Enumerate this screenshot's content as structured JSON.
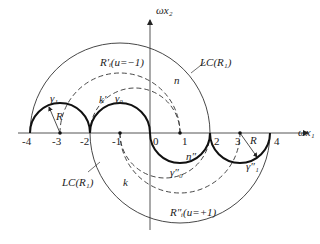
{
  "axes": {
    "x_label": "ωx₁",
    "y_label": "ωx₂"
  },
  "ticks": [
    "-4",
    "-3",
    "-2",
    "-1",
    "0",
    "1",
    "2",
    "3",
    "4"
  ],
  "labels": {
    "lc_top": "LC(R₁)",
    "lc_bottom": "LC(R₁)",
    "r_top": "R′ᵢ(u=−1)",
    "r_bottom": "R″ᵢ(u=+1)",
    "gamma1": "γ₁",
    "gamma0": "γ₀",
    "gamma0_pp": "γ″₀",
    "gamma1_pp": "γ″₁",
    "k_prime": "k′",
    "k": "k",
    "n": "n",
    "n_pp": "n″",
    "R_left": "R",
    "R_right": "R"
  }
}
